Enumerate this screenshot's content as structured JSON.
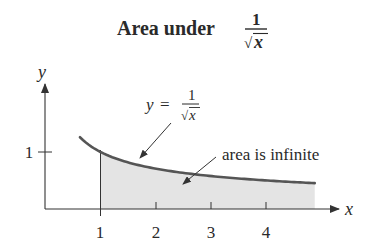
{
  "title": {
    "prefix": "Area under",
    "fraction_numerator": "1",
    "fraction_denominator_radical": "√",
    "fraction_denominator_var": "x"
  },
  "axes": {
    "x_label": "x",
    "y_label": "y",
    "x_ticks": [
      "1",
      "2",
      "3",
      "4"
    ],
    "y_ticks": [
      "1"
    ]
  },
  "curve_label": {
    "lhs": "y",
    "equals": "=",
    "numerator": "1",
    "radical": "√",
    "var": "x"
  },
  "area_label": "area is infinite",
  "colors": {
    "curve": "#555555",
    "shading": "#e4e4e4",
    "axis": "#333333",
    "text": "#2a2a2a"
  },
  "chart_data": {
    "type": "area",
    "xlabel": "x",
    "ylabel": "y",
    "function": "y = 1/sqrt(x)",
    "curve_x_range": [
      0.63,
      4.86
    ],
    "shaded_x_range": [
      1,
      4.86
    ],
    "x_ticks": [
      1,
      2,
      3,
      4
    ],
    "y_ticks": [
      1
    ],
    "annotations": [
      "y = 1/√x",
      "area is infinite"
    ],
    "grid": false
  }
}
